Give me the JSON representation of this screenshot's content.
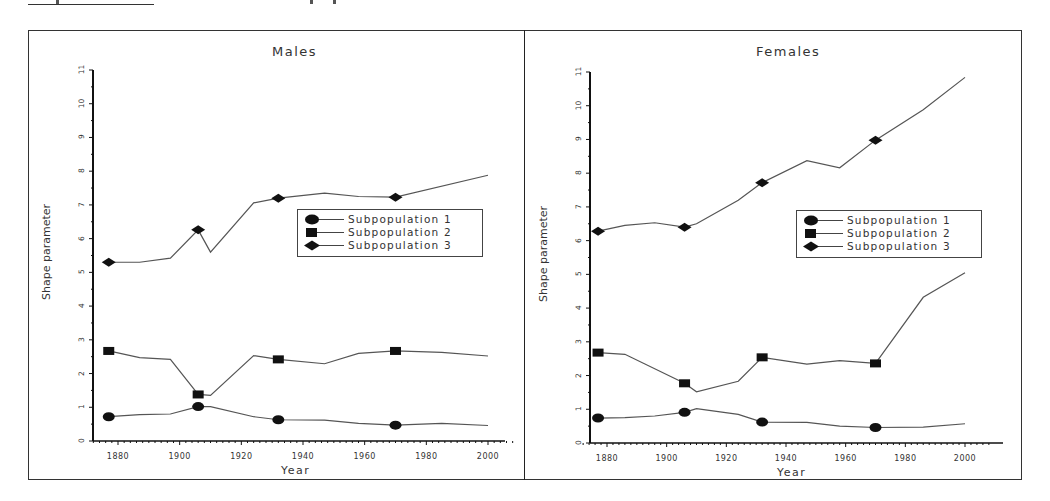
{
  "chart_data": [
    {
      "type": "line",
      "title": "Males",
      "xlabel": "Year",
      "ylabel": "Shape parameter",
      "xlim": [
        1870,
        2010
      ],
      "ylim": [
        0,
        11
      ],
      "x_ticks": [
        1880,
        1900,
        1920,
        1940,
        1960,
        1980,
        2000
      ],
      "y_ticks": [
        0,
        1,
        2,
        3,
        4,
        5,
        6,
        7,
        8,
        9,
        10,
        11
      ],
      "grid": false,
      "legend_position": "center-right",
      "legend": [
        "Subpopulation 1",
        "Subpopulation 2",
        "Subpopulation 3"
      ],
      "series": [
        {
          "name": "Subpopulation 1",
          "marker": "circle",
          "x": [
            1877,
            1887,
            1897,
            1906,
            1910,
            1924,
            1932,
            1947,
            1958,
            1970,
            1985,
            2000
          ],
          "y": [
            0.72,
            0.78,
            0.8,
            1.02,
            1.02,
            0.72,
            0.63,
            0.62,
            0.52,
            0.47,
            0.52,
            0.46
          ],
          "marked_x": [
            1877,
            1906,
            1932,
            1970
          ]
        },
        {
          "name": "Subpopulation 2",
          "marker": "square",
          "x": [
            1877,
            1887,
            1897,
            1906,
            1910,
            1924,
            1932,
            1947,
            1958,
            1970,
            1985,
            2000
          ],
          "y": [
            2.67,
            2.47,
            2.42,
            1.38,
            1.35,
            2.53,
            2.42,
            2.29,
            2.6,
            2.67,
            2.63,
            2.52
          ],
          "marked_x": [
            1877,
            1906,
            1932,
            1970
          ]
        },
        {
          "name": "Subpopulation 3",
          "marker": "diamond",
          "x": [
            1877,
            1887,
            1897,
            1906,
            1910,
            1924,
            1932,
            1947,
            1958,
            1970,
            2000
          ],
          "y": [
            5.3,
            5.3,
            5.42,
            6.26,
            5.6,
            7.06,
            7.2,
            7.35,
            7.25,
            7.23,
            7.88
          ],
          "marked_x": [
            1877,
            1906,
            1932,
            1970
          ]
        }
      ]
    },
    {
      "type": "line",
      "title": "Females",
      "xlabel": "Year",
      "ylabel": "Shape parameter",
      "xlim": [
        1870,
        2010
      ],
      "ylim": [
        0,
        11
      ],
      "x_ticks": [
        1880,
        1900,
        1920,
        1940,
        1960,
        1980,
        2000
      ],
      "y_ticks": [
        0,
        1,
        2,
        3,
        4,
        5,
        6,
        7,
        8,
        9,
        10,
        11
      ],
      "grid": false,
      "legend_position": "center-right",
      "legend": [
        "Subpopulation 1",
        "Subpopulation 2",
        "Subpopulation 3"
      ],
      "series": [
        {
          "name": "Subpopulation 1",
          "marker": "circle",
          "x": [
            1877,
            1886,
            1896,
            1906,
            1910,
            1924,
            1932,
            1947,
            1958,
            1970,
            1986,
            2000
          ],
          "y": [
            0.74,
            0.75,
            0.8,
            0.91,
            1.02,
            0.85,
            0.62,
            0.61,
            0.5,
            0.46,
            0.47,
            0.57
          ],
          "marked_x": [
            1877,
            1906,
            1932,
            1970
          ]
        },
        {
          "name": "Subpopulation 2",
          "marker": "square",
          "x": [
            1877,
            1886,
            1906,
            1910,
            1924,
            1932,
            1947,
            1958,
            1970,
            1986,
            2000
          ],
          "y": [
            2.68,
            2.63,
            1.77,
            1.52,
            1.83,
            2.54,
            2.34,
            2.44,
            2.36,
            4.32,
            5.05
          ],
          "marked_x": [
            1877,
            1906,
            1932,
            1970
          ]
        },
        {
          "name": "Subpopulation 3",
          "marker": "diamond",
          "x": [
            1877,
            1886,
            1896,
            1906,
            1910,
            1924,
            1932,
            1947,
            1958,
            1970,
            1986,
            2000
          ],
          "y": [
            6.28,
            6.45,
            6.53,
            6.4,
            6.5,
            7.2,
            7.72,
            8.37,
            8.16,
            8.98,
            9.88,
            10.84
          ],
          "marked_x": [
            1877,
            1906,
            1932,
            1970
          ]
        }
      ]
    }
  ],
  "panels": [
    {
      "title": "Males",
      "xlabel": "Year",
      "ylabel": "Shape parameter",
      "legend": [
        "Subpopulation 1",
        "Subpopulation 2",
        "Subpopulation 3"
      ],
      "x_tick_labels": [
        "1880",
        "1900",
        "1920",
        "1940",
        "1960",
        "1980",
        "2000"
      ],
      "y_tick_labels": [
        "0",
        "1",
        "2",
        "3",
        "4",
        "5",
        "6",
        "7",
        "8",
        "9",
        "10",
        "11"
      ]
    },
    {
      "title": "Females",
      "xlabel": "Year",
      "ylabel": "Shape parameter",
      "legend": [
        "Subpopulation 1",
        "Subpopulation 2",
        "Subpopulation 3"
      ],
      "x_tick_labels": [
        "1880",
        "1900",
        "1920",
        "1940",
        "1960",
        "1980",
        "2000"
      ],
      "y_tick_labels": [
        "0",
        "1",
        "2",
        "3",
        "4",
        "5",
        "6",
        "7",
        "8",
        "9",
        "10",
        "11"
      ]
    }
  ],
  "colors": {
    "line": "#555555",
    "marker": "#111111",
    "axis": "#111111",
    "frame": "#333333"
  }
}
